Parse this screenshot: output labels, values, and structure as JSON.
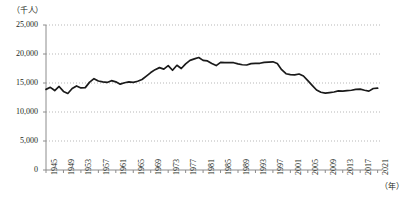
{
  "chart_data": {
    "type": "line",
    "title": "",
    "subtitle": "",
    "ylabel": "（千人）",
    "xlabel": "（年）",
    "ylim": [
      0,
      25000
    ],
    "xlim": [
      1945,
      2022
    ],
    "grid": true,
    "legend": false,
    "y_ticks": [
      "0",
      "5,000",
      "10,000",
      "15,000",
      "20,000",
      "25,000"
    ],
    "y_tick_values": [
      0,
      5000,
      10000,
      15000,
      20000,
      25000
    ],
    "x_ticks": [
      "1945",
      "1949",
      "1953",
      "1957",
      "1961",
      "1965",
      "1969",
      "1973",
      "1977",
      "1981",
      "1985",
      "1989",
      "1993",
      "1997",
      "2001",
      "2005",
      "2009",
      "2013",
      "2017",
      "2021"
    ],
    "series": [
      {
        "name": "人数",
        "color": "#1a1a1a",
        "x": [
          1945,
          1946,
          1947,
          1948,
          1949,
          1950,
          1951,
          1952,
          1953,
          1954,
          1955,
          1956,
          1957,
          1958,
          1959,
          1960,
          1961,
          1962,
          1963,
          1964,
          1965,
          1966,
          1967,
          1968,
          1969,
          1970,
          1971,
          1972,
          1973,
          1974,
          1975,
          1976,
          1977,
          1978,
          1979,
          1980,
          1981,
          1982,
          1983,
          1984,
          1985,
          1986,
          1987,
          1988,
          1989,
          1990,
          1991,
          1992,
          1993,
          1994,
          1995,
          1996,
          1997,
          1998,
          1999,
          2000,
          2001,
          2002,
          2003,
          2004,
          2005,
          2006,
          2007,
          2008,
          2009,
          2010,
          2011,
          2012,
          2013,
          2014,
          2015,
          2016,
          2017,
          2018,
          2019,
          2020,
          2021
        ],
        "values": [
          13900,
          14250,
          13700,
          14400,
          13550,
          13200,
          14050,
          14500,
          14150,
          14200,
          15150,
          15750,
          15350,
          15200,
          15100,
          15400,
          15200,
          14800,
          15050,
          15200,
          15100,
          15300,
          15600,
          16200,
          16800,
          17300,
          17650,
          17400,
          18000,
          17200,
          18050,
          17500,
          18300,
          18900,
          19150,
          19400,
          18900,
          18800,
          18350,
          18000,
          18550,
          18500,
          18500,
          18500,
          18300,
          18150,
          18100,
          18350,
          18400,
          18400,
          18550,
          18600,
          18650,
          18350,
          17300,
          16600,
          16450,
          16400,
          16550,
          16200,
          15400,
          14600,
          13800,
          13400,
          13250,
          13350,
          13450,
          13650,
          13600,
          13700,
          13750,
          13900,
          13950,
          13750,
          13600,
          14050,
          14100
        ]
      }
    ]
  },
  "axis": {
    "unit_y": "（千人）",
    "unit_x": "（年）"
  },
  "source": {
    "note": ""
  }
}
